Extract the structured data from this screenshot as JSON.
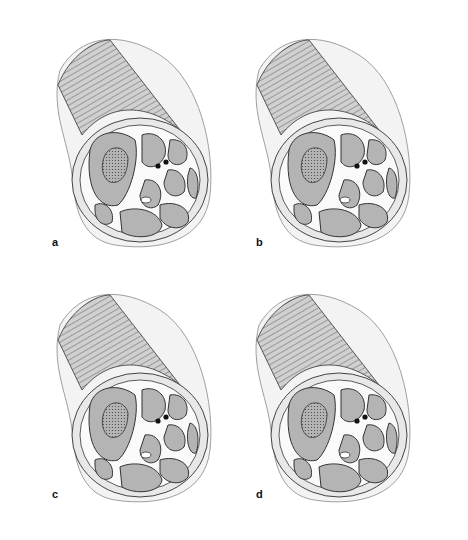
{
  "figure": {
    "panels": [
      {
        "id": "a",
        "label": "a"
      },
      {
        "id": "b",
        "label": "b"
      },
      {
        "id": "c",
        "label": "c"
      },
      {
        "id": "d",
        "label": "d"
      }
    ]
  },
  "colors": {
    "background": "#ffffff",
    "skin": "#ececec",
    "muscle": "#b4b4b4",
    "outline": "#333333",
    "vessel": "#111111"
  }
}
